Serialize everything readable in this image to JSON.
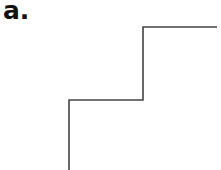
{
  "panel": {
    "label": "a."
  },
  "diagram": {
    "type": "step-line",
    "stroke_color": "#444444",
    "points": [
      [
        69,
        170
      ],
      [
        69,
        100
      ],
      [
        143,
        100
      ],
      [
        143,
        27
      ],
      [
        217,
        27
      ]
    ]
  }
}
